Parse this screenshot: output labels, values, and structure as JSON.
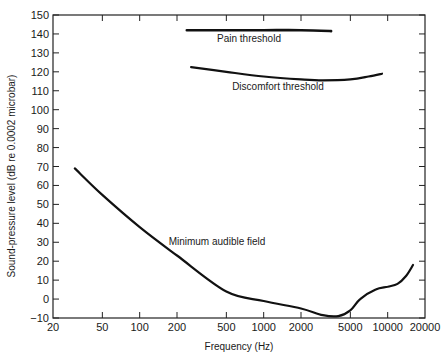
{
  "chart_data": {
    "type": "line",
    "title": "",
    "xlabel": "Frequency (Hz)",
    "ylabel": "Sound-pressure level (dB re 0.0002 microbar)",
    "xscale": "log",
    "xlim": [
      20,
      20000
    ],
    "ylim": [
      -10,
      150
    ],
    "x_ticks": [
      20,
      50,
      100,
      200,
      500,
      1000,
      2000,
      5000,
      10000,
      20000
    ],
    "x_tick_labels": [
      "20",
      "50",
      "100",
      "200",
      "500",
      "1000",
      "2000",
      "5000",
      "10000",
      "20000"
    ],
    "y_ticks": [
      -10,
      0,
      10,
      20,
      30,
      40,
      50,
      60,
      70,
      80,
      90,
      100,
      110,
      120,
      130,
      140,
      150
    ],
    "y_tick_labels": [
      "−10",
      "0",
      "10",
      "20",
      "30",
      "40",
      "50",
      "60",
      "70",
      "80",
      "90",
      "100",
      "110",
      "120",
      "130",
      "140",
      "150"
    ],
    "grid": false,
    "legend": "none (curves annotated inline)",
    "series": [
      {
        "name": "Pain threshold",
        "x": [
          240,
          500,
          1000,
          2000,
          3500
        ],
        "y": [
          142,
          142,
          142,
          142,
          141.5
        ]
      },
      {
        "name": "Discomfort threshold",
        "x": [
          260,
          500,
          1000,
          2000,
          3000,
          5000,
          7000,
          9000
        ],
        "y": [
          122.5,
          120,
          117.5,
          116,
          115.5,
          116,
          117.5,
          119
        ]
      },
      {
        "name": "Minimum audible field",
        "x": [
          30,
          50,
          100,
          200,
          500,
          1000,
          2000,
          3000,
          4000,
          5000,
          6000,
          8000,
          10000,
          12000,
          14000,
          16000
        ],
        "y": [
          69,
          55,
          38,
          23,
          4,
          -1,
          -5,
          -8.5,
          -9,
          -6,
          0,
          5,
          6.5,
          8,
          12,
          18
        ]
      }
    ],
    "annotations": [
      {
        "text": "Pain threshold",
        "near_x": 900,
        "near_y": 138
      },
      {
        "text": "Discomfort threshold",
        "near_x": 2000,
        "near_y": 110
      },
      {
        "text": "Minimum audible field",
        "near_x": 500,
        "near_y": 36
      }
    ]
  },
  "labels": {
    "xlabel": "Frequency (Hz)",
    "ylabel": "Sound-pressure level (dB re 0.0002 microbar)",
    "pain": "Pain threshold",
    "discomfort": "Discomfort threshold",
    "maf": "Minimum audible field"
  }
}
